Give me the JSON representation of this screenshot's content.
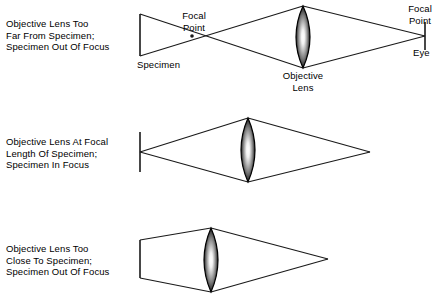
{
  "figure": {
    "line_color": "#1a1a1a",
    "text_color": "#000000",
    "background": "#ffffff",
    "lens_edge_color": "#000000",
    "lens_highlight_color": "#ffffff",
    "lens_shadow_color": "#2a2a2a"
  },
  "panels": [
    {
      "id": "top",
      "caption_lines": [
        "Objective Lens Too",
        "Far From Specimen;",
        "Specimen Out Of Focus"
      ],
      "labels": {
        "specimen": "Specimen",
        "focal_point_left": [
          "Focal",
          "Point"
        ],
        "focal_point_right": [
          "Focal",
          "Point"
        ],
        "eye": "Eye",
        "objective_lens": [
          "Objective",
          "Lens"
        ]
      },
      "geometry": {
        "specimen_x": 140,
        "specimen_top_y": 14,
        "specimen_bottom_y": 56,
        "focal_point_x": 192,
        "focal_point_y": 36,
        "lens_center_x": 303,
        "lens_top_y": 6,
        "lens_bottom_y": 68,
        "lens_half_width": 14,
        "converge_x": 425,
        "converge_y": 36
      }
    },
    {
      "id": "middle",
      "caption_lines": [
        "Objective Lens At Focal",
        "Length Of Specimen;",
        "Specimen In Focus"
      ],
      "labels": {},
      "geometry": {
        "specimen_x": 140,
        "specimen_top_y": 132,
        "specimen_bottom_y": 172,
        "source_y": 152,
        "lens_center_x": 248,
        "lens_top_y": 118,
        "lens_bottom_y": 182,
        "lens_half_width": 14,
        "converge_x": 370,
        "converge_y": 152
      }
    },
    {
      "id": "bottom",
      "caption_lines": [
        "Objective Lens Too",
        "Close To Specimen;",
        "Specimen Out Of Focus"
      ],
      "labels": {},
      "geometry": {
        "specimen_x": 140,
        "specimen_top_y": 240,
        "specimen_bottom_y": 278,
        "lens_center_x": 211,
        "lens_top_y": 228,
        "lens_bottom_y": 292,
        "lens_half_width": 14,
        "converge_x": 328,
        "converge_y": 259
      }
    }
  ]
}
